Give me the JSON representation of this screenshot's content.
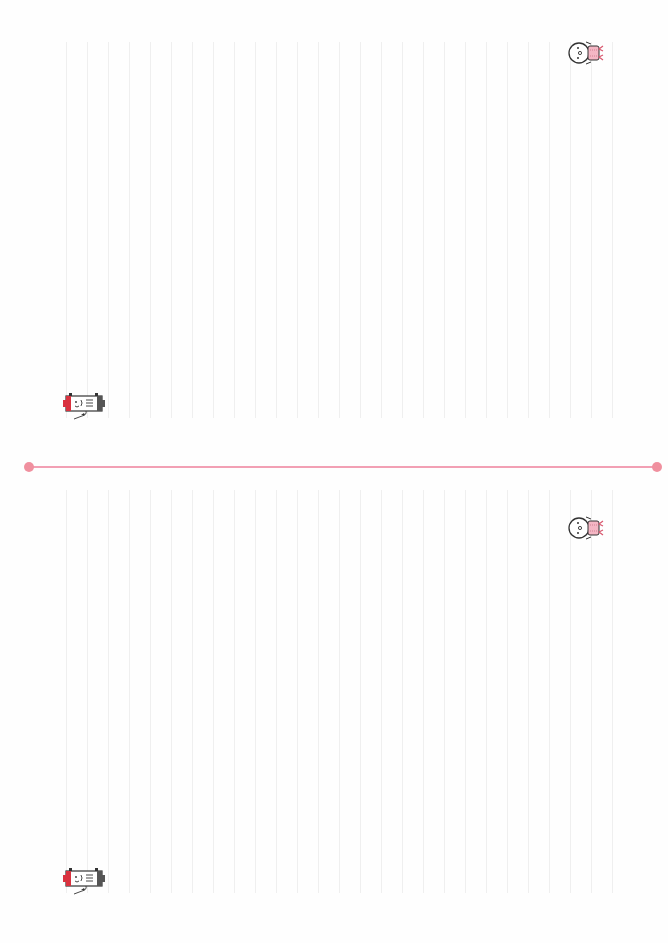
{
  "paper": {
    "type": "lined-letter-paper",
    "halves": 2,
    "line_color": "#efefef",
    "line_spacing_px": 21,
    "divider_color": "#f2a0b4",
    "divider_dot_color": "#f0909f"
  },
  "top_half": {
    "decorations": [
      {
        "name": "snowman-character-icon",
        "accent": "#f4b6c4"
      },
      {
        "name": "battery-character-icon",
        "accent": "#d9323f"
      }
    ]
  },
  "bottom_half": {
    "decorations": [
      {
        "name": "snowman-character-icon",
        "accent": "#f4b6c4"
      },
      {
        "name": "battery-character-icon",
        "accent": "#d9323f"
      }
    ]
  }
}
